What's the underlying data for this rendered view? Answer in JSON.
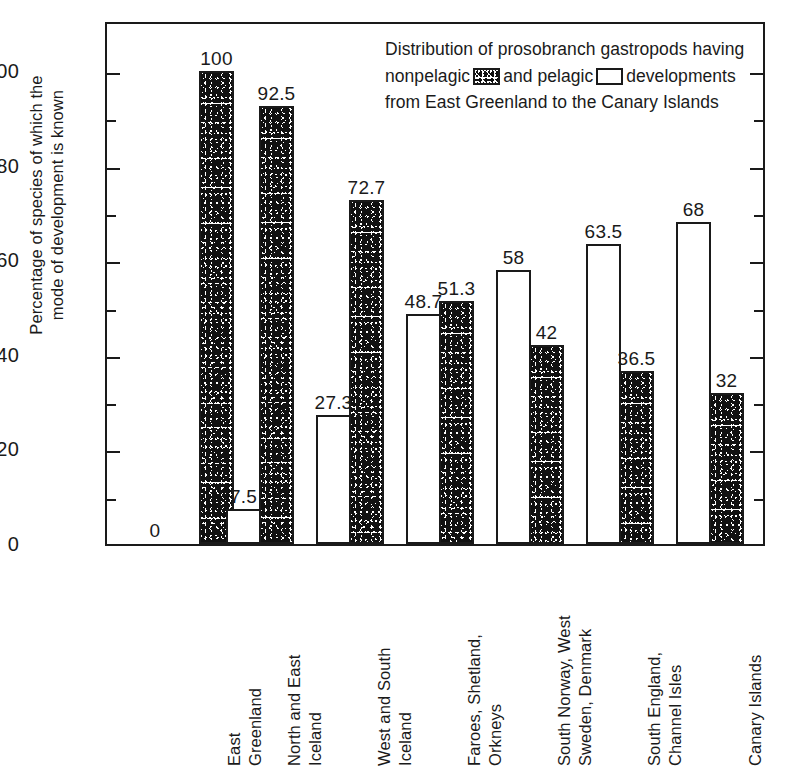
{
  "chart_data": {
    "type": "bar",
    "xlabel": "",
    "ylabel": "Percentage of species of which the mode of development is known",
    "ylim": [
      0,
      108
    ],
    "yticks_major": [
      0,
      20,
      40,
      60,
      80,
      100
    ],
    "yticks_minor": [
      10,
      30,
      50,
      70,
      90
    ],
    "grid": false,
    "legend_position": "inside-top-right",
    "categories": [
      "East Greenland",
      "North and East Iceland",
      "West and South Iceland",
      "Faroes, Shetland, Orkneys",
      "South Norway, West Sweden, Denmark",
      "South England, Channel Isles",
      "Canary Islands"
    ],
    "series": [
      {
        "name": "pelagic",
        "values": [
          0,
          7.5,
          27.3,
          48.7,
          58,
          63.5,
          68
        ]
      },
      {
        "name": "nonpelagic",
        "values": [
          100,
          92.5,
          72.7,
          51.3,
          42,
          36.5,
          32
        ]
      }
    ],
    "value_labels": {
      "pelagic": [
        "0",
        "7.5",
        "27.3",
        "48.7",
        "58",
        "63.5",
        "68"
      ],
      "nonpelagic": [
        "100",
        "92.5",
        "72.7",
        "51.3",
        "42",
        "36.5",
        "32"
      ]
    }
  },
  "axis": {
    "y_title_line1": "Percentage of species of which the",
    "y_title_line2": "mode of development is known",
    "y_tick_labels": [
      "100",
      "80",
      "60",
      "40",
      "20",
      "0"
    ]
  },
  "caption": {
    "part1": "Distribution of prosobranch gastropods having nonpelagic",
    "part2": "and pelagic",
    "part3": "developments from East Greenland to the Canary Islands",
    "swatch_nonpelagic_name": "stippled-swatch",
    "swatch_pelagic_name": "white-swatch"
  },
  "x_labels": [
    {
      "line1": "East",
      "line2": "Greenland"
    },
    {
      "line1": "North and East",
      "line2": "Iceland"
    },
    {
      "line1": "West and South",
      "line2": "Iceland"
    },
    {
      "line1": "Faroes, Shetland,",
      "line2": "Orkneys"
    },
    {
      "line1": "South Norway, West",
      "line2": "Sweden, Denmark"
    },
    {
      "line1": "South England,",
      "line2": "Channel Isles"
    },
    {
      "line1": "Canary Islands",
      "line2": ""
    }
  ],
  "colors": {
    "ink": "#1a1a1a",
    "paper": "#ffffff"
  }
}
